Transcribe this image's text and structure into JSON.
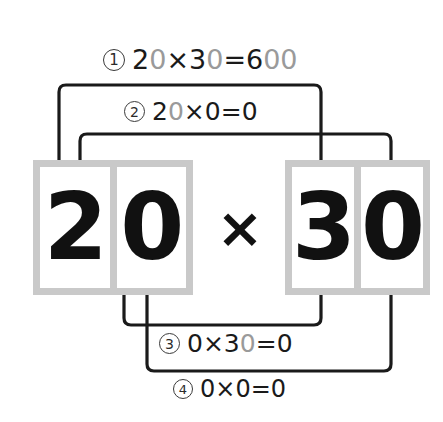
{
  "diagram": {
    "expression": {
      "left_operand": {
        "digits": [
          "2",
          "0"
        ]
      },
      "operator": "×",
      "right_operand": {
        "digits": [
          "3",
          "0"
        ]
      }
    },
    "steps": [
      {
        "marker": "①",
        "marker_number": "1",
        "parts": [
          {
            "text": "2",
            "dim": false
          },
          {
            "text": "0",
            "dim": true
          },
          {
            "text": "×",
            "dim": false
          },
          {
            "text": "3",
            "dim": false
          },
          {
            "text": "0",
            "dim": true
          },
          {
            "text": "=",
            "dim": false
          },
          {
            "text": "6",
            "dim": false
          },
          {
            "text": "00",
            "dim": true
          }
        ],
        "plain": "20×30=600"
      },
      {
        "marker": "②",
        "marker_number": "2",
        "parts": [
          {
            "text": "2",
            "dim": false
          },
          {
            "text": "0",
            "dim": true
          },
          {
            "text": "×",
            "dim": false
          },
          {
            "text": "0",
            "dim": false
          },
          {
            "text": "=",
            "dim": false
          },
          {
            "text": "0",
            "dim": false
          }
        ],
        "plain": "20×0=0"
      },
      {
        "marker": "③",
        "marker_number": "3",
        "parts": [
          {
            "text": "0",
            "dim": false
          },
          {
            "text": "×",
            "dim": false
          },
          {
            "text": "3",
            "dim": false
          },
          {
            "text": "0",
            "dim": true
          },
          {
            "text": "=",
            "dim": false
          },
          {
            "text": "0",
            "dim": false
          }
        ],
        "plain": "0×30=0"
      },
      {
        "marker": "④",
        "marker_number": "4",
        "parts": [
          {
            "text": "0",
            "dim": false
          },
          {
            "text": "×",
            "dim": false
          },
          {
            "text": "0",
            "dim": false
          },
          {
            "text": "=",
            "dim": false
          },
          {
            "text": "0",
            "dim": false
          }
        ],
        "plain": "0×0=0"
      }
    ],
    "colors": {
      "box_frame": "#c9c9c9",
      "cell_fill": "#ffffff",
      "digit": "#111111",
      "dim_digit": "#9a9a9a",
      "wire": "#1a1a1a",
      "background": "#ffffff"
    }
  }
}
